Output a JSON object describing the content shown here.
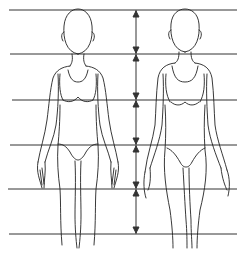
{
  "diagram": {
    "type": "body-proportion-guide",
    "figures": [
      {
        "id": "figure-left",
        "label": ""
      },
      {
        "id": "figure-right",
        "label": ""
      }
    ],
    "guide_lines_y": [
      10,
      54,
      100,
      145,
      189,
      234
    ],
    "measure_arrow_x": 136,
    "colors": {
      "line": "#333333",
      "background": "#ffffff"
    }
  }
}
